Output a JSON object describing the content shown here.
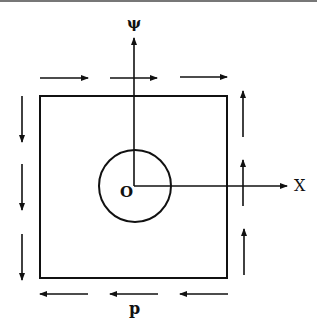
{
  "diagram": {
    "labels": {
      "psi_axis": "ψ",
      "x_axis": "X",
      "origin": "O",
      "shear_load": "p"
    },
    "elements": {
      "square_plate": {
        "x1": 40,
        "y1": 95,
        "x2": 227,
        "y2": 278
      },
      "hole": {
        "cx": 135,
        "cy": 186,
        "r": 37
      },
      "top_arrows_direction": "right",
      "bottom_arrows_direction": "left",
      "left_arrows_direction": "down",
      "right_arrows_direction": "up"
    },
    "colors": {
      "ink": "#111111",
      "background": "#ffffff"
    }
  }
}
